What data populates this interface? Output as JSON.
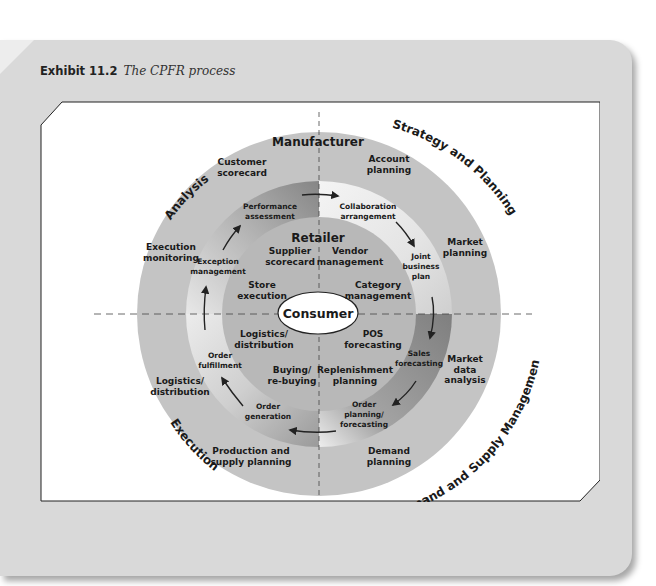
{
  "caption": {
    "label": "Exhibit 11.2",
    "title": "The CPFR process"
  },
  "diagram": {
    "title": "The CPFR process",
    "center": "Consumer",
    "outer_ring_title": "Manufacturer",
    "inner_ring_title": "Retailer",
    "quadrant_labels": {
      "top_left": "Analysis",
      "top_right": "Strategy and Planning",
      "bottom_right": "Demand and Supply Management",
      "bottom_left": "Execution"
    },
    "manufacturer_tasks": {
      "customer_scorecard": [
        "Customer",
        "scorecard"
      ],
      "account_planning": [
        "Account",
        "planning"
      ],
      "market_planning": [
        "Market",
        "planning"
      ],
      "market_data_analysis": [
        "Market",
        "data",
        "analysis"
      ],
      "demand_planning": [
        "Demand",
        "planning"
      ],
      "production_supply_planning": [
        "Production and",
        "supply planning"
      ],
      "logistics_distribution": [
        "Logistics/",
        "distribution"
      ],
      "execution_monitoring": [
        "Execution",
        "monitoring"
      ]
    },
    "collaboration_tasks": {
      "performance_assessment": [
        "Performance",
        "assessment"
      ],
      "collaboration_arrangement": [
        "Collaboration",
        "arrangement"
      ],
      "joint_business_plan": [
        "Joint",
        "business",
        "plan"
      ],
      "sales_forecasting": [
        "Sales",
        "forecasting"
      ],
      "order_planning_forecasting": [
        "Order",
        "planning/",
        "forecasting"
      ],
      "order_generation": [
        "Order",
        "generation"
      ],
      "order_fulfillment": [
        "Order",
        "fulfillment"
      ],
      "exception_management": [
        "Exception",
        "management"
      ]
    },
    "retailer_tasks": {
      "supplier_scorecard": [
        "Supplier",
        "scorecard"
      ],
      "vendor_management": [
        "Vendor",
        "management"
      ],
      "category_management": [
        "Category",
        "management"
      ],
      "pos_forecasting": [
        "POS",
        "forecasting"
      ],
      "replenishment_planning": [
        "Replenishment",
        "planning"
      ],
      "buying_rebuying": [
        "Buying/",
        "re-buying"
      ],
      "logistics_distribution": [
        "Logistics/",
        "distribution"
      ],
      "store_execution": [
        "Store",
        "execution"
      ]
    },
    "colors": {
      "outer_ring": "#c4c4c4",
      "inner_disk": "#b5b5b5",
      "ring_dark": "#8c8c8c",
      "ring_light": "#f2f2f2",
      "card_bg": "#d9d9d9",
      "center_fill": "#ffffff"
    }
  }
}
